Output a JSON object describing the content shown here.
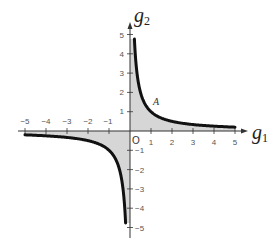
{
  "chart_data": {
    "type": "line",
    "title": "",
    "function": "g2 = 1 / g1",
    "xlabel": "g",
    "xlabel_sub": "1",
    "ylabel": "g",
    "ylabel_sub": "2",
    "xlim": [
      -5,
      5
    ],
    "ylim": [
      -5,
      5
    ],
    "x_ticks": [
      -5,
      -4,
      -3,
      -2,
      -1,
      1,
      2,
      3,
      4,
      5
    ],
    "y_ticks": [
      5,
      4,
      3,
      2,
      1,
      -1,
      -2,
      -3,
      -4,
      -5
    ],
    "origin_label": "O",
    "grid": false,
    "series": [
      {
        "name": "branch-positive",
        "x": [
          0.21,
          0.25,
          0.33,
          0.5,
          1,
          2,
          3,
          4,
          5
        ],
        "y": [
          4.76,
          4,
          3,
          2,
          1,
          0.5,
          0.33,
          0.25,
          0.2
        ]
      },
      {
        "name": "branch-negative",
        "x": [
          -5,
          -4,
          -3,
          -2,
          -1,
          -0.5,
          -0.33,
          -0.25,
          -0.21
        ],
        "y": [
          -0.2,
          -0.25,
          -0.33,
          -0.5,
          -1,
          -2,
          -3,
          -4,
          -4.76
        ]
      }
    ],
    "shaded_regions": [
      {
        "name": "area-under-positive-branch",
        "x_range": [
          0,
          5
        ],
        "style": "vertical-hatch"
      },
      {
        "name": "area-above-negative-branch",
        "x_range": [
          -5,
          0
        ],
        "style": "vertical-hatch"
      }
    ],
    "annotations": [
      {
        "label": "A",
        "x": 1,
        "y": 1
      }
    ]
  },
  "labels": {
    "x_axis": "g",
    "x_axis_sub": "1",
    "y_axis": "g",
    "y_axis_sub": "2",
    "origin": "O",
    "point_a": "A",
    "xt_m5": "−5",
    "xt_m4": "−4",
    "xt_m3": "−3",
    "xt_m2": "−2",
    "xt_m1": "−1",
    "xt_1": "1",
    "xt_2": "2",
    "xt_3": "3",
    "xt_4": "4",
    "xt_5": "5",
    "yt_5": "5",
    "yt_4": "4",
    "yt_3": "3",
    "yt_2": "2",
    "yt_1": "1",
    "yt_m1": "−1",
    "yt_m2": "−2",
    "yt_m3": "−3",
    "yt_m4": "−4",
    "yt_m5": "−5"
  }
}
